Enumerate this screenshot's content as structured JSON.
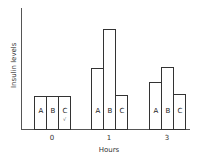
{
  "chart_data": {
    "type": "bar",
    "title": "",
    "xlabel": "Hours",
    "ylabel": "Insulin levels",
    "categories": [
      "0",
      "1",
      "3"
    ],
    "series": [
      {
        "name": "A",
        "values": [
          27,
          50,
          39
        ]
      },
      {
        "name": "B",
        "values": [
          27,
          83,
          51
        ]
      },
      {
        "name": "C",
        "values": [
          27,
          28,
          29
        ]
      }
    ],
    "ylim": [
      0,
      100
    ],
    "units_note": "relative (no y tick labels shown)",
    "grid": false,
    "legend": "none; series letters printed inside bars",
    "annotations": [
      {
        "category": "0",
        "series": "C",
        "text": "√"
      }
    ]
  },
  "style": {
    "axis_color": "#555555",
    "bar_border": "#333333",
    "bar_fill": "#ffffff"
  }
}
